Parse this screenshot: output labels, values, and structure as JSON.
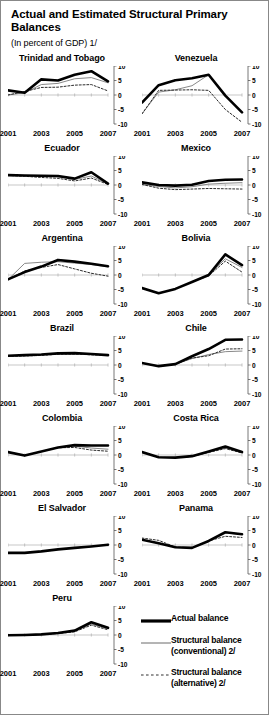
{
  "figure": {
    "title": "Actual and Estimated Structural Primary Balances",
    "subtitle": "(In percent of GDP) 1/"
  },
  "legend": {
    "items": [
      {
        "label": "Actual balance",
        "style": "thick-solid",
        "color": "#000000"
      },
      {
        "label": "Structural balance (conventional) 2/",
        "style": "thin-solid",
        "color": "#666666"
      },
      {
        "label": "Structural balance (alternative) 2/",
        "style": "dotted",
        "color": "#333333"
      }
    ]
  },
  "axes": {
    "ylim": [
      -10,
      10
    ],
    "yticks": [
      10,
      5,
      0,
      -5,
      -10
    ],
    "ytick_labels": [
      "10",
      "5",
      "0",
      "-5",
      "-10"
    ],
    "x": [
      2001,
      2002,
      2003,
      2004,
      2005,
      2006,
      2007
    ],
    "xtick_labels": [
      "2001",
      "2003",
      "2005",
      "2007"
    ],
    "xticks": [
      2001,
      2003,
      2005,
      2007
    ]
  },
  "chart_data": {
    "type": "line",
    "title": "Actual and Estimated Structural Primary Balances",
    "subtitle": "(In percent of GDP) 1/",
    "xlabel": "",
    "ylabel": "Percent of GDP",
    "ylim": [
      -10,
      10
    ],
    "x": [
      2001,
      2002,
      2003,
      2004,
      2005,
      2006,
      2007
    ],
    "grid": false,
    "legend_position": "bottom-right",
    "series_names": [
      "Actual balance",
      "Structural balance (conventional) 2/",
      "Structural balance (alternative) 2/"
    ],
    "panels": [
      {
        "name": "Trinidad and Tobago",
        "series": [
          {
            "name": "Actual balance",
            "values": [
              1.6,
              0.8,
              5.4,
              5.0,
              7.0,
              8.2,
              4.7
            ]
          },
          {
            "name": "Structural balance (conventional) 2/",
            "values": [
              0.0,
              0.8,
              3.6,
              4.0,
              5.6,
              6.0,
              4.2
            ]
          },
          {
            "name": "Structural balance (alternative) 2/",
            "values": [
              0.0,
              1.2,
              2.6,
              2.7,
              3.4,
              3.6,
              1.4
            ]
          }
        ]
      },
      {
        "name": "Venezuela",
        "series": [
          {
            "name": "Actual balance",
            "values": [
              -2.6,
              3.4,
              5.1,
              5.8,
              7.0,
              -0.2,
              -6.0
            ]
          },
          {
            "name": "Structural balance (conventional) 2/",
            "values": [
              -6.5,
              1.0,
              1.8,
              3.2,
              7.0,
              0.0,
              -6.0
            ]
          },
          {
            "name": "Structural balance (alternative) 2/",
            "values": [
              -6.5,
              1.6,
              1.7,
              1.8,
              1.6,
              -5.0,
              -9.4
            ]
          }
        ]
      },
      {
        "name": "Ecuador",
        "series": [
          {
            "name": "Actual balance",
            "values": [
              3.4,
              3.3,
              3.2,
              3.1,
              2.2,
              4.4,
              0.5
            ]
          },
          {
            "name": "Structural balance (conventional) 2/",
            "values": [
              3.3,
              3.2,
              3.0,
              2.8,
              1.9,
              3.1,
              0.4
            ]
          },
          {
            "name": "Structural balance (alternative) 2/",
            "values": [
              3.3,
              3.0,
              2.6,
              2.3,
              1.4,
              2.4,
              0.2
            ]
          }
        ]
      },
      {
        "name": "Mexico",
        "series": [
          {
            "name": "Actual balance",
            "values": [
              0.9,
              0.0,
              -0.2,
              0.1,
              1.4,
              1.8,
              1.9
            ]
          },
          {
            "name": "Structural balance (conventional) 2/",
            "values": [
              0.2,
              -0.5,
              -1.0,
              -0.6,
              0.3,
              0.6,
              0.8
            ]
          },
          {
            "name": "Structural balance (alternative) 2/",
            "values": [
              0.2,
              -1.1,
              -1.6,
              -1.4,
              -1.2,
              -1.3,
              -1.4
            ]
          }
        ]
      },
      {
        "name": "Argentina",
        "series": [
          {
            "name": "Actual balance",
            "values": [
              -1.5,
              1.0,
              2.9,
              5.2,
              4.6,
              3.9,
              3.0
            ]
          },
          {
            "name": "Structural balance (conventional) 2/",
            "values": [
              -1.6,
              4.0,
              4.4,
              4.6,
              4.1,
              3.6,
              2.8
            ]
          },
          {
            "name": "Structural balance (alternative) 2/",
            "values": [
              -1.6,
              1.4,
              2.6,
              3.6,
              2.1,
              0.6,
              -0.4
            ]
          }
        ]
      },
      {
        "name": "Bolivia",
        "series": [
          {
            "name": "Actual balance",
            "values": [
              -4.5,
              -6.3,
              -4.8,
              -2.4,
              0.0,
              7.1,
              3.4
            ]
          },
          {
            "name": "Structural balance (conventional) 2/",
            "values": [
              -4.5,
              -6.3,
              -4.8,
              -2.4,
              0.0,
              5.6,
              2.6
            ]
          },
          {
            "name": "Structural balance (alternative) 2/",
            "values": [
              -4.5,
              -6.3,
              -4.8,
              -2.4,
              -0.3,
              4.8,
              1.0
            ]
          }
        ]
      },
      {
        "name": "Brazil",
        "series": [
          {
            "name": "Actual balance",
            "values": [
              3.2,
              3.4,
              3.6,
              4.0,
              4.1,
              3.8,
              3.4
            ]
          },
          {
            "name": "Structural balance (conventional) 2/",
            "values": [
              3.1,
              3.3,
              3.5,
              3.9,
              4.0,
              3.7,
              3.4
            ]
          },
          {
            "name": "Structural balance (alternative) 2/",
            "values": [
              3.0,
              3.1,
              3.3,
              3.7,
              3.8,
              3.5,
              3.3
            ]
          }
        ]
      },
      {
        "name": "Chile",
        "series": [
          {
            "name": "Actual balance",
            "values": [
              0.7,
              -0.4,
              0.3,
              3.0,
              5.5,
              8.7,
              8.8
            ]
          },
          {
            "name": "Structural balance (conventional) 2/",
            "values": [
              0.6,
              -0.4,
              0.3,
              2.2,
              3.6,
              4.6,
              4.8
            ]
          },
          {
            "name": "Structural balance (alternative) 2/",
            "values": [
              0.6,
              -0.4,
              0.3,
              2.4,
              3.2,
              5.5,
              5.6
            ]
          }
        ]
      },
      {
        "name": "Colombia",
        "series": [
          {
            "name": "Actual balance",
            "values": [
              1.0,
              -0.2,
              1.2,
              2.6,
              3.4,
              3.3,
              3.3
            ]
          },
          {
            "name": "Structural balance (conventional) 2/",
            "values": [
              1.0,
              -0.2,
              1.2,
              2.6,
              3.1,
              2.4,
              2.0
            ]
          },
          {
            "name": "Structural balance (alternative) 2/",
            "values": [
              1.0,
              -0.2,
              1.2,
              2.5,
              2.6,
              1.7,
              1.3
            ]
          }
        ]
      },
      {
        "name": "Costa Rica",
        "series": [
          {
            "name": "Actual balance",
            "values": [
              1.0,
              -0.8,
              -0.9,
              -0.4,
              1.2,
              2.9,
              1.0
            ]
          },
          {
            "name": "Structural balance (conventional) 2/",
            "values": [
              1.0,
              -0.8,
              -0.9,
              -0.5,
              1.0,
              2.4,
              0.8
            ]
          },
          {
            "name": "Structural balance (alternative) 2/",
            "values": [
              1.0,
              -0.8,
              -0.9,
              -0.5,
              0.9,
              2.2,
              0.7
            ]
          }
        ]
      },
      {
        "name": "El Salvador",
        "series": [
          {
            "name": "Actual balance",
            "values": [
              -2.7,
              -2.7,
              -2.2,
              -1.5,
              -1.0,
              -0.5,
              0.1
            ]
          },
          {
            "name": "Structural balance (conventional) 2/",
            "values": [
              -2.7,
              -2.7,
              -2.2,
              -1.5,
              -1.0,
              -0.5,
              0.1
            ]
          },
          {
            "name": "Structural balance (alternative) 2/",
            "values": [
              -2.7,
              -2.7,
              -2.2,
              -1.5,
              -1.0,
              -0.5,
              0.1
            ]
          }
        ]
      },
      {
        "name": "Panama",
        "series": [
          {
            "name": "Actual balance",
            "values": [
              1.8,
              0.6,
              -0.8,
              -1.0,
              1.4,
              4.4,
              3.7
            ]
          },
          {
            "name": "Structural balance (conventional) 2/",
            "values": [
              1.8,
              0.6,
              -0.8,
              -1.0,
              1.4,
              4.2,
              3.6
            ]
          },
          {
            "name": "Structural balance (alternative) 2/",
            "values": [
              2.4,
              1.6,
              -0.7,
              -1.0,
              1.4,
              3.0,
              2.6
            ]
          }
        ]
      },
      {
        "name": "Peru",
        "series": [
          {
            "name": "Actual balance",
            "values": [
              -0.1,
              0.0,
              0.2,
              0.7,
              1.5,
              4.4,
              2.5
            ]
          },
          {
            "name": "Structural balance (conventional) 2/",
            "values": [
              -0.1,
              0.0,
              0.2,
              0.6,
              1.3,
              3.8,
              2.1
            ]
          },
          {
            "name": "Structural balance (alternative) 2/",
            "values": [
              -0.1,
              0.0,
              0.2,
              0.5,
              1.1,
              3.4,
              1.8
            ]
          }
        ]
      }
    ]
  }
}
